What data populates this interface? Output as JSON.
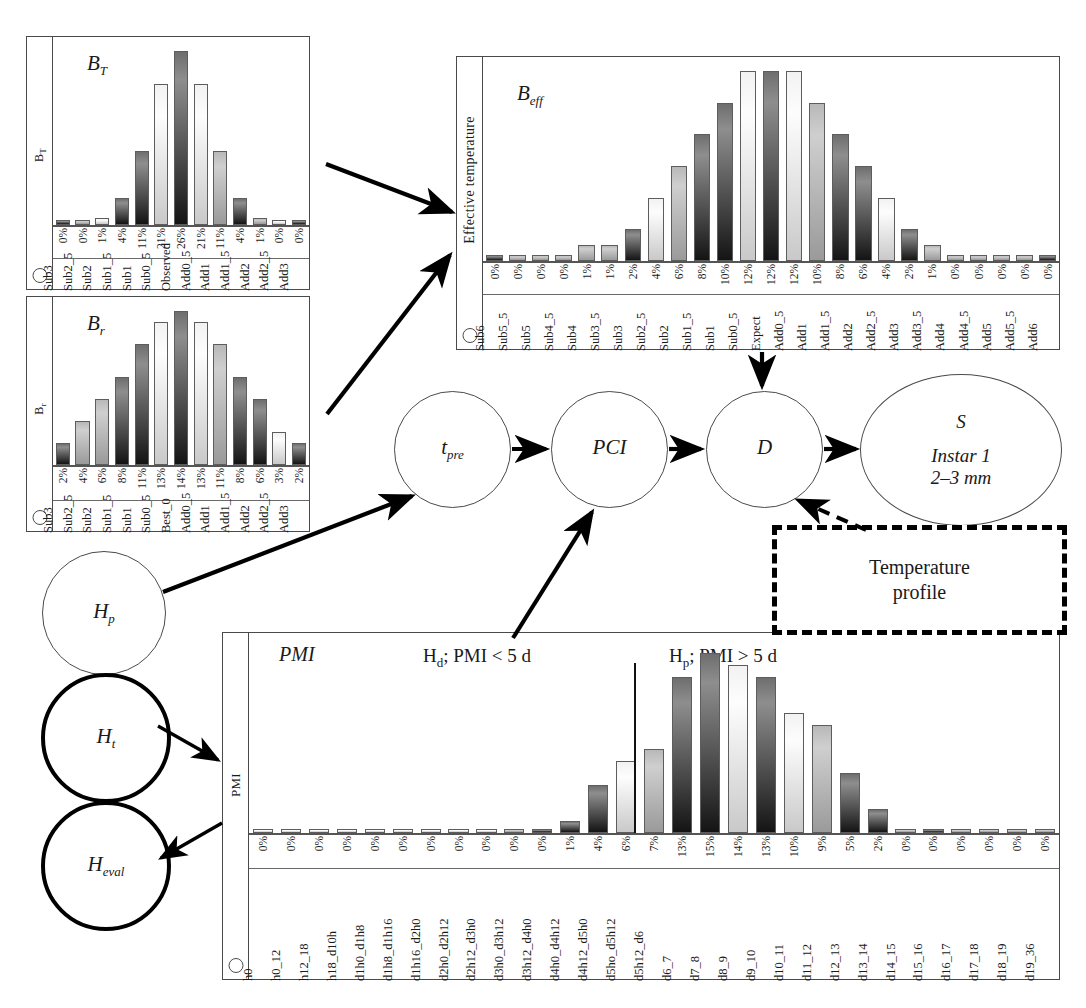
{
  "nodes": [
    {
      "name": "t_pre",
      "label": "t",
      "sub": "pre"
    },
    {
      "name": "PCI",
      "label": "PCI",
      "sub": ""
    },
    {
      "name": "D",
      "label": "D",
      "sub": ""
    },
    {
      "name": "H_p",
      "label": "H",
      "sub": "p"
    },
    {
      "name": "H_t",
      "label": "H",
      "sub": "t"
    },
    {
      "name": "H_eval",
      "label": "H",
      "sub": "eval"
    }
  ],
  "stage_node": {
    "tag": "S",
    "line1": "Instar 1",
    "line2": "2–3 mm"
  },
  "temperature_box": {
    "line1": "Temperature",
    "line2": "profile"
  },
  "pmi_headers": {
    "left_main": "H",
    "left_sub": "d",
    "left_rest": "; PMI < 5 d",
    "right_main": "H",
    "right_sub": "p",
    "right_rest": "; PMI > 5 d"
  },
  "chart_data": [
    {
      "id": "BT",
      "type": "bar",
      "title": "B_T",
      "title_main": "B",
      "title_sub": "T",
      "ylabel": "B",
      "ylabel_sub": "T",
      "categories": [
        "Sub3",
        "Sub2_5",
        "Sub2",
        "Sub1_5",
        "Sub1",
        "Sub0_5",
        "Observed",
        "Add0_5",
        "Add1",
        "Add1_5",
        "Add2",
        "Add2_5",
        "Add3"
      ],
      "values": [
        0,
        0,
        1,
        4,
        11,
        21,
        26,
        21,
        11,
        4,
        1,
        0,
        0
      ],
      "labels": [
        "0%",
        "0%",
        "1%",
        "4%",
        "11%",
        "21%",
        "26%",
        "21%",
        "11%",
        "4%",
        "1%",
        "0%",
        "0%"
      ],
      "shades": [
        "dk",
        "md",
        "lt",
        "dk",
        "dk",
        "lt",
        "dk",
        "lt",
        "md",
        "dk",
        "md",
        "lt",
        "dk"
      ],
      "ylim": [
        0,
        26
      ],
      "grid": false,
      "legend": "none"
    },
    {
      "id": "Br",
      "type": "bar",
      "title": "B_r",
      "title_main": "B",
      "title_sub": "r",
      "ylabel": "B",
      "ylabel_sub": "r",
      "categories": [
        "Sub3",
        "Sub2_5",
        "Sub2",
        "Sub1_5",
        "Sub1",
        "Sub0_5",
        "Best_0",
        "Add0_5",
        "Add1",
        "Add1_5",
        "Add2",
        "Add2_5",
        "Add3"
      ],
      "values": [
        2,
        4,
        6,
        8,
        11,
        13,
        14,
        13,
        11,
        8,
        6,
        3,
        2
      ],
      "labels": [
        "2%",
        "4%",
        "6%",
        "8%",
        "11%",
        "13%",
        "14%",
        "13%",
        "11%",
        "8%",
        "6%",
        "3%",
        "2%"
      ],
      "shades": [
        "dk",
        "md",
        "md",
        "dk",
        "dk",
        "lt",
        "dk",
        "lt",
        "md",
        "dk",
        "dk",
        "lt",
        "dk"
      ],
      "ylim": [
        0,
        14
      ],
      "grid": false,
      "legend": "none"
    },
    {
      "id": "Beff",
      "type": "bar",
      "title": "B_eff",
      "title_main": "B",
      "title_sub": "eff",
      "ylabel": "Effective temperature",
      "ylabel_sub": "",
      "categories": [
        "Sub6",
        "Sub5_5",
        "Sub5",
        "Sub4_5",
        "Sub4",
        "Sub3_5",
        "Sub3",
        "Sub2_5",
        "Sub2",
        "Sub1_5",
        "Sub1",
        "Sub0_5",
        "Expect",
        "Add0_5",
        "Add1",
        "Add1_5",
        "Add2",
        "Add2_5",
        "Add3",
        "Add3_5",
        "Add4",
        "Add4_5",
        "Add5",
        "Add5_5",
        "Add6"
      ],
      "values": [
        0,
        0,
        0,
        0,
        1,
        1,
        2,
        4,
        6,
        8,
        10,
        12,
        12,
        12,
        10,
        8,
        6,
        4,
        2,
        1,
        0,
        0,
        0,
        0,
        0
      ],
      "labels": [
        "0%",
        "0%",
        "0%",
        "0%",
        "1%",
        "1%",
        "2%",
        "4%",
        "6%",
        "8%",
        "10%",
        "12%",
        "12%",
        "12%",
        "10%",
        "8%",
        "6%",
        "4%",
        "2%",
        "1%",
        "0%",
        "0%",
        "0%",
        "0%",
        "0%"
      ],
      "shades": [
        "dk",
        "md",
        "md",
        "md",
        "md",
        "md",
        "dk",
        "lt",
        "md",
        "dk",
        "dk",
        "lt",
        "dk",
        "lt",
        "md",
        "dk",
        "dk",
        "lt",
        "dk",
        "md",
        "md",
        "md",
        "md",
        "md",
        "dk"
      ],
      "ylim": [
        0,
        12
      ],
      "grid": false,
      "legend": "none"
    },
    {
      "id": "PMI",
      "type": "bar",
      "title": "PMI",
      "title_main": "PMI",
      "title_sub": "",
      "ylabel": "PMI",
      "ylabel_sub": "",
      "categories": [
        "h0",
        "h0_12",
        "h12_18",
        "h18_d10h",
        "d1h0_d1h8",
        "d1h8_d1h16",
        "d1h16_d2h0",
        "d2h0_d2h12",
        "d2h12_d3h0",
        "d3h0_d3h12",
        "d3h12_d4h0",
        "d4h0_d4h12",
        "d4h12_d5h0",
        "d5ho_d5h12",
        "d5h12_d6",
        "d6_7",
        "d7_8",
        "d8_9",
        "d9_10",
        "d10_11",
        "d11_12",
        "d12_13",
        "d13_14",
        "d14_15",
        "d15_16",
        "d16_17",
        "d17_18",
        "d18_19",
        "d19_36"
      ],
      "values": [
        0,
        0,
        0,
        0,
        0,
        0,
        0,
        0,
        0,
        0,
        0,
        1,
        4,
        6,
        7,
        13,
        15,
        14,
        13,
        10,
        9,
        5,
        2,
        0,
        0,
        0,
        0,
        0,
        0
      ],
      "labels": [
        "0%",
        "0%",
        "0%",
        "0%",
        "0%",
        "0%",
        "0%",
        "0%",
        "0%",
        "0%",
        "0%",
        "1%",
        "4%",
        "6%",
        "7%",
        "13%",
        "15%",
        "14%",
        "13%",
        "10%",
        "9%",
        "5%",
        "2%",
        "0%",
        "0%",
        "0%",
        "0%",
        "0%",
        "0%"
      ],
      "shades": [
        "lt",
        "lt",
        "lt",
        "lt",
        "lt",
        "lt",
        "lt",
        "lt",
        "lt",
        "md",
        "dk",
        "dk",
        "dk",
        "lt",
        "md",
        "dk",
        "dk",
        "lt",
        "dk",
        "lt",
        "md",
        "dk",
        "dk",
        "md",
        "dk",
        "md",
        "md",
        "md",
        "md"
      ],
      "ylim": [
        0,
        15
      ],
      "grid": false,
      "legend": "none",
      "split_after_index": 14
    }
  ]
}
